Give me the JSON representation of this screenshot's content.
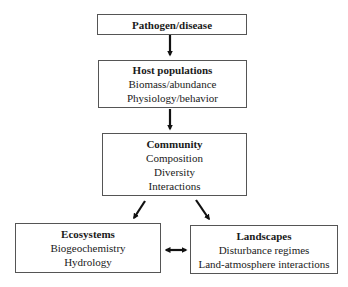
{
  "nodes": {
    "pathogen": {
      "title": "Pathogen/disease",
      "lines": []
    },
    "host": {
      "title": "Host populations",
      "lines": [
        "Biomass/abundance",
        "Physiology/behavior"
      ]
    },
    "community": {
      "title": "Community",
      "lines": [
        "Composition",
        "Diversity",
        "Interactions"
      ]
    },
    "ecosystems": {
      "title": "Ecosystems",
      "lines": [
        "Biogeochemistry",
        "Hydrology"
      ]
    },
    "landscapes": {
      "title": "Landscapes",
      "lines": [
        "Disturbance regimes",
        "Land-atmosphere interactions"
      ]
    }
  },
  "edges": [
    {
      "from": "pathogen",
      "to": "host",
      "type": "directed"
    },
    {
      "from": "host",
      "to": "community",
      "type": "directed"
    },
    {
      "from": "community",
      "to": "ecosystems",
      "type": "directed"
    },
    {
      "from": "community",
      "to": "landscapes",
      "type": "directed"
    },
    {
      "from": "ecosystems",
      "to": "landscapes",
      "type": "bidirectional"
    }
  ]
}
